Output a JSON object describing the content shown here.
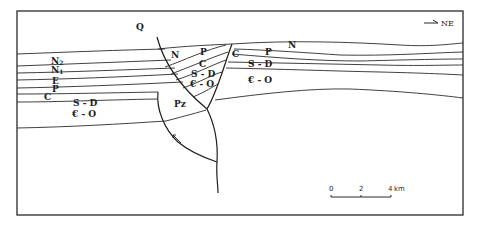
{
  "figure": {
    "type": "geological cross-section",
    "orientation_label": "NE",
    "orientation_arrow_icon": "arrow-right-icon"
  },
  "units": {
    "cover": "Q",
    "left_block": {
      "N2": {
        "base": "N",
        "sub": "2"
      },
      "N1": {
        "base": "N",
        "sub": "1"
      },
      "E": "E",
      "P": "P",
      "C": "C",
      "SD": "S - D",
      "CO": "€ - O"
    },
    "wedge_block": {
      "N": "N",
      "P": "P",
      "C": "C",
      "SD": "S - D",
      "CO": "€ - O"
    },
    "basement_block": {
      "Pz": "Pz"
    },
    "right_block": {
      "N": "N",
      "C": "C",
      "P": "P",
      "SD": "S - D",
      "CO": "€ - O"
    }
  },
  "scale_bar": {
    "ticks": [
      "0",
      "2",
      "4"
    ],
    "unit": "km"
  }
}
